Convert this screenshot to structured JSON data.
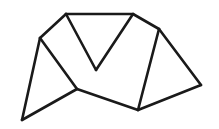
{
  "diagram": {
    "type": "line-drawing",
    "stroke_color": "#1a1a1a",
    "background_color": "#ffffff",
    "vertices": {
      "A": "top-left vertex",
      "B": "left vertex",
      "C": "top-right vertex",
      "V": "valley vertex",
      "D": "upper-right vertex",
      "E": "far-right vertex",
      "F": "bottom-center vertex",
      "G": "middle-low vertex",
      "H": "bottom-left vertex"
    },
    "edges": [
      [
        "A",
        "C"
      ],
      [
        "A",
        "B"
      ],
      [
        "A",
        "V"
      ],
      [
        "V",
        "C"
      ],
      [
        "C",
        "D"
      ],
      [
        "B",
        "H"
      ],
      [
        "B",
        "G"
      ],
      [
        "H",
        "G"
      ],
      [
        "G",
        "F"
      ],
      [
        "F",
        "D"
      ],
      [
        "D",
        "E"
      ],
      [
        "E",
        "F"
      ]
    ]
  }
}
